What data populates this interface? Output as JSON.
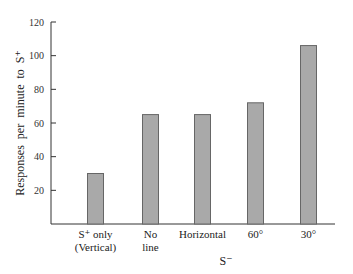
{
  "chart_data": {
    "type": "bar",
    "title": "",
    "xlabel": "S⁻",
    "ylabel": "Responses per minute to S⁺",
    "ylim": [
      0,
      120
    ],
    "yticks": [
      20,
      40,
      60,
      80,
      100,
      120
    ],
    "yticklabels": [
      "20",
      "40",
      "60",
      "80",
      "100",
      "120"
    ],
    "categories": [
      [
        "S⁺  only",
        "(Vertical)"
      ],
      [
        "No",
        "line"
      ],
      [
        "Horizontal"
      ],
      [
        "60°"
      ],
      [
        "30°"
      ]
    ],
    "values": [
      30,
      65,
      65,
      72,
      106
    ],
    "grid": false,
    "legend": null,
    "bar_color": "#a9a9a9",
    "bar_edge_color": "#666666"
  }
}
